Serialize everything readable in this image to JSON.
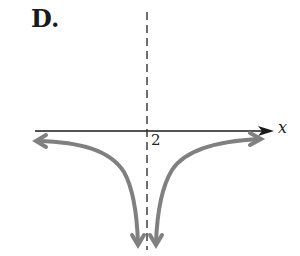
{
  "figure": {
    "label": "D.",
    "x_axis_label": "x",
    "asymptote_label": "2"
  },
  "colors": {
    "axis": "#1a1a1a",
    "curve": "#808080",
    "asymptote": "#333333"
  }
}
